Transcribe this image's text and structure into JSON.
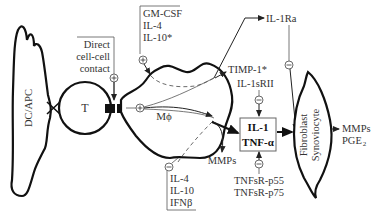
{
  "diagram": {
    "cells": {
      "dc_apc": "DC/APC",
      "t_cell": "T",
      "macrophage": "Mϕ",
      "fibroblast_line1": "Fibroblast",
      "fibroblast_line2": "Synoviocyte"
    },
    "labels": {
      "direct_contact_1": "Direct",
      "direct_contact_2": "cell-cell",
      "direct_contact_3": "contact",
      "stim_1": "GM-CSF",
      "stim_2": "IL-4",
      "stim_3": "IL-10*",
      "inhib_1": "IL-4",
      "inhib_2": "IL-10",
      "inhib_3": "IFNβ",
      "il1ra": "IL-1Ra",
      "timp": "TIMP-1*",
      "il1srii": "IL-1sRII",
      "mmps_mac": "MMPs",
      "box_line1": "IL-1",
      "box_line2": "TNF-α",
      "tnfsr_1": "TNFsR-p55",
      "tnfsr_2": "TNFsR-p75",
      "out_mmps": "MMPs",
      "out_pge": "PGE",
      "out_pge_sub": "2"
    },
    "signs": {
      "plus": "+",
      "minus": "−"
    },
    "colors": {
      "outline": "#111111",
      "text": "#333333",
      "connector": "#555555"
    }
  }
}
